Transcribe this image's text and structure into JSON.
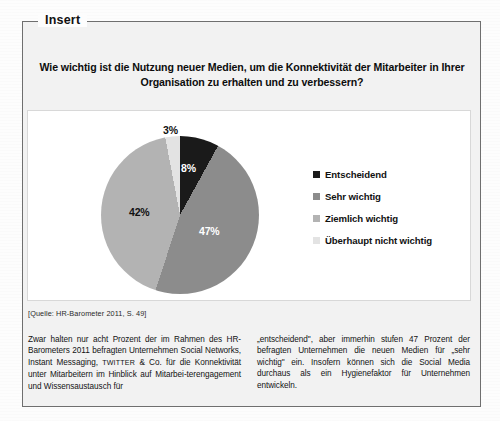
{
  "box": {
    "legend_title": "Insert",
    "question": "Wie wichtig ist die Nutzung neuer Medien, um die Konnektivität der Mitarbeiter in Ihrer Organisation zu erhalten und zu verbessern?",
    "source": "[Quelle: HR-Barometer 2011, S. 49]"
  },
  "chart_data": {
    "type": "pie",
    "title": "Wie wichtig ist die Nutzung neuer Medien, um die Konnektivität der Mitarbeiter in Ihrer Organisation zu erhalten und zu verbessern?",
    "categories": [
      "Entscheidend",
      "Sehr wichtig",
      "Ziemlich wichtig",
      "Überhaupt nicht wichtig"
    ],
    "values": [
      8,
      47,
      42,
      3
    ],
    "value_labels": [
      "8%",
      "47%",
      "42%",
      "3%"
    ],
    "colors": [
      "#1a1a1a",
      "#8c8c8c",
      "#b3b3b3",
      "#e3e3e3"
    ],
    "legend_position": "right",
    "start_angle_deg": 0,
    "grid": false,
    "unit": "%",
    "source": "[Quelle: HR-Barometer 2011, S. 49]"
  },
  "body": {
    "left_parts": {
      "a": "Zwar halten nur acht Prozent der im Rahmen des HR-Barometers 2011 befragten Unternehmen Social Networks, Instant Messaging, ",
      "twitter": "TWITTER",
      "b": " & Co. für die Konnektivität unter Mitarbeitern im Hinblick auf Mitarbei-terengagement und Wissensaustausch für"
    },
    "right": "„entscheidend\", aber immerhin stufen 47 Prozent der befragten Unternehmen die neuen Medien für „sehr wichtig\" ein. Insofern können sich die Social Media durchaus als ein Hygienefaktor für Unternehmen entwickeln."
  }
}
